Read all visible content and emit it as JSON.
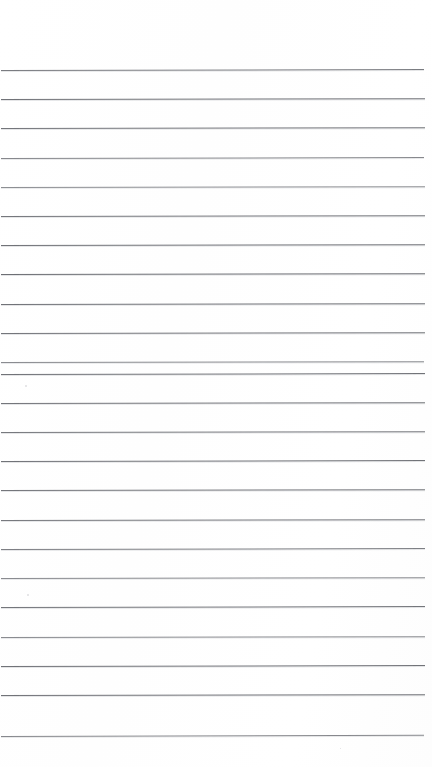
{
  "document": {
    "kind": "scanned-lined-paper",
    "title": "Blank ruled notebook page",
    "page_width": 432,
    "page_height": 767,
    "background_color": "#ffffff",
    "has_text_content": false,
    "written_content": "",
    "alt_text": "A blank scanned sheet of ruled notebook paper with evenly spaced horizontal lines and no writing."
  },
  "ruling": {
    "line_color": "#5e6066",
    "line_thickness": 1,
    "line_count": 24,
    "first_line_y": 70,
    "line_spacing": 29.3,
    "line_start_x": 1,
    "line_end_x": 425,
    "top_margin": 70,
    "bottom_margin": 30,
    "has_vertical_margin_rule": false,
    "lines": [
      {
        "index": 1,
        "y": 70,
        "x1": 1,
        "x2": 424,
        "opacity": 0.82,
        "slope": -0.9
      },
      {
        "index": 2,
        "y": 99,
        "x1": 1,
        "x2": 425,
        "opacity": 0.88,
        "slope": -0.8
      },
      {
        "index": 3,
        "y": 128,
        "x1": 1,
        "x2": 425,
        "opacity": 0.86,
        "slope": -0.8
      },
      {
        "index": 4,
        "y": 158,
        "x1": 1,
        "x2": 424,
        "opacity": 0.74,
        "slope": -0.9
      },
      {
        "index": 5,
        "y": 187,
        "x1": 1,
        "x2": 425,
        "opacity": 0.7,
        "slope": -0.7
      },
      {
        "index": 6,
        "y": 216,
        "x1": 1,
        "x2": 425,
        "opacity": 0.85,
        "slope": -0.8
      },
      {
        "index": 7,
        "y": 245,
        "x1": 1,
        "x2": 425,
        "opacity": 0.88,
        "slope": -0.7
      },
      {
        "index": 8,
        "y": 274,
        "x1": 1,
        "x2": 425,
        "opacity": 0.9,
        "slope": -0.8
      },
      {
        "index": 9,
        "y": 304,
        "x1": 1,
        "x2": 425,
        "opacity": 0.88,
        "slope": -0.7
      },
      {
        "index": 10,
        "y": 333,
        "x1": 1,
        "x2": 425,
        "opacity": 0.86,
        "slope": -0.8
      },
      {
        "index": 11,
        "y": 362,
        "x1": 1,
        "x2": 424,
        "opacity": 0.72,
        "slope": -0.8
      },
      {
        "index": 12,
        "y": 374,
        "x1": 1,
        "x2": 425,
        "opacity": 0.88,
        "slope": -0.9
      },
      {
        "index": 13,
        "y": 403,
        "x1": 1,
        "x2": 425,
        "opacity": 0.86,
        "slope": -0.8
      },
      {
        "index": 14,
        "y": 432,
        "x1": 1,
        "x2": 425,
        "opacity": 0.84,
        "slope": -0.8
      },
      {
        "index": 15,
        "y": 461,
        "x1": 1,
        "x2": 425,
        "opacity": 0.88,
        "slope": -0.9
      },
      {
        "index": 16,
        "y": 490,
        "x1": 1,
        "x2": 425,
        "opacity": 0.86,
        "slope": -0.8
      },
      {
        "index": 17,
        "y": 520,
        "x1": 1,
        "x2": 425,
        "opacity": 0.84,
        "slope": -0.8
      },
      {
        "index": 18,
        "y": 549,
        "x1": 1,
        "x2": 425,
        "opacity": 0.8,
        "slope": -0.9
      },
      {
        "index": 19,
        "y": 578,
        "x1": 1,
        "x2": 425,
        "opacity": 0.72,
        "slope": -0.8
      },
      {
        "index": 20,
        "y": 607,
        "x1": 1,
        "x2": 425,
        "opacity": 0.86,
        "slope": -0.9
      },
      {
        "index": 21,
        "y": 637,
        "x1": 1,
        "x2": 425,
        "opacity": 0.72,
        "slope": -0.8
      },
      {
        "index": 22,
        "y": 666,
        "x1": 1,
        "x2": 425,
        "opacity": 0.88,
        "slope": -0.9
      },
      {
        "index": 23,
        "y": 695,
        "x1": 1,
        "x2": 425,
        "opacity": 0.88,
        "slope": -0.8
      },
      {
        "index": 24,
        "y": 736,
        "x1": 1,
        "x2": 424,
        "opacity": 0.74,
        "slope": -1.2
      }
    ]
  },
  "artifacts": {
    "specks": [
      {
        "x": 25,
        "y": 385,
        "size": 2
      },
      {
        "x": 27,
        "y": 594,
        "size": 2
      },
      {
        "x": 340,
        "y": 748,
        "size": 1
      }
    ]
  }
}
